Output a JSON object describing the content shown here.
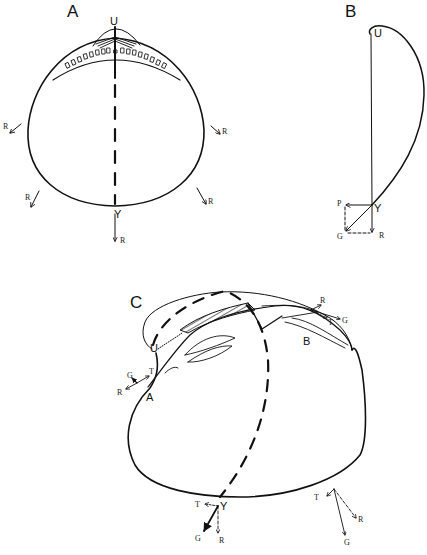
{
  "figure": {
    "panels": [
      {
        "id": "A",
        "label": "A",
        "description": "Valve outline viewed along hinge axis with dashed growth axis U–Y and radial growth vectors R",
        "points": {
          "umbo": "U",
          "ventral": "Y"
        },
        "vector_labels": [
          "R",
          "R",
          "R",
          "R",
          "R"
        ]
      },
      {
        "id": "B",
        "label": "B",
        "description": "Lateral profile with growth vector decomposition at Y",
        "points": {
          "umbo": "U",
          "ventral": "Y"
        },
        "vector_labels": {
          "p": "P",
          "g": "G",
          "r": "R"
        }
      },
      {
        "id": "C",
        "label": "C",
        "description": "Oblique view of valve with dashed growth axis and vector triads at points A, B, Y",
        "points": {
          "anterior": "A",
          "posterior": "B",
          "umbo": "U",
          "ventral": "Y"
        },
        "vector_groups": [
          {
            "at": "B",
            "labels": [
              "R",
              "T",
              "G"
            ]
          },
          {
            "at": "A",
            "labels": [
              "G",
              "T",
              "R"
            ]
          },
          {
            "at": "Y",
            "labels": [
              "T",
              "G",
              "R"
            ]
          },
          {
            "at": "posterior-ventral",
            "labels": [
              "T",
              "R",
              "G"
            ]
          }
        ]
      }
    ]
  }
}
